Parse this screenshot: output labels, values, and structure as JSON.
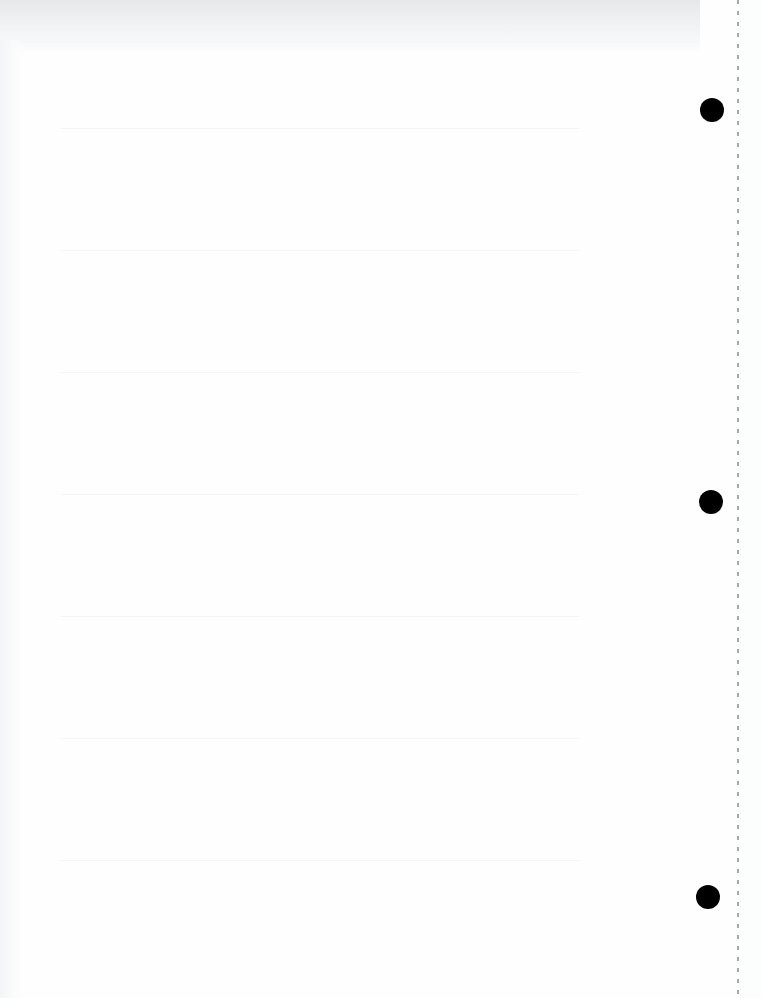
{
  "document": {
    "type": "blank scanned notebook paper",
    "visible_text": "",
    "punch_holes": [
      {
        "cx": 712,
        "cy": 110,
        "r": 12
      },
      {
        "cx": 711,
        "cy": 502,
        "r": 12
      },
      {
        "cx": 708,
        "cy": 897,
        "r": 12
      }
    ],
    "perforation_x": 738,
    "colors": {
      "paper": "#fefefe",
      "top_band": "#e6e8ea",
      "hole": "#000000",
      "perforation": "#8a8a8a"
    }
  }
}
